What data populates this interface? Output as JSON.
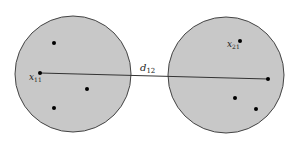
{
  "diagram": {
    "background": "#ffffff",
    "fill_color": "#c8c8c8",
    "stroke_color": "#444444",
    "point_color": "#000000",
    "clusters": [
      {
        "name": "cluster-1",
        "cx": 73,
        "cy": 74,
        "r": 58,
        "points": [
          {
            "x": 54,
            "y": 43
          },
          {
            "x": 40,
            "y": 73,
            "label": "x",
            "subscript": "11"
          },
          {
            "x": 87,
            "y": 89
          },
          {
            "x": 54,
            "y": 108
          }
        ]
      },
      {
        "name": "cluster-2",
        "cx": 226,
        "cy": 75,
        "r": 58,
        "points": [
          {
            "x": 240,
            "y": 41,
            "label": "x",
            "subscript": "21"
          },
          {
            "x": 268,
            "y": 79
          },
          {
            "x": 235,
            "y": 98
          },
          {
            "x": 256,
            "y": 109
          }
        ]
      }
    ],
    "distance": {
      "from": {
        "x": 40,
        "y": 73
      },
      "to": {
        "x": 268,
        "y": 79
      },
      "label": "d",
      "subscript": "12"
    }
  }
}
